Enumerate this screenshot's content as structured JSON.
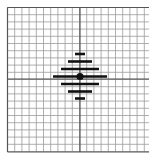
{
  "diagram": {
    "type": "grid-pattern",
    "background": "#ffffff",
    "grid": {
      "left": 7.5,
      "top": 7.5,
      "right": 150,
      "bottom": 152,
      "cell": 7.2,
      "line_color": "#9a9a9a",
      "border_color": "#555555"
    },
    "axes": {
      "x": 80,
      "y": 79,
      "color": "#4a4a4a"
    },
    "bars": [
      {
        "y": 54,
        "x1": 75,
        "x2": 85
      },
      {
        "y": 61.5,
        "x1": 68,
        "x2": 92
      },
      {
        "y": 69,
        "x1": 61,
        "x2": 99
      },
      {
        "y": 76.5,
        "x1": 53,
        "x2": 107
      },
      {
        "y": 84,
        "x1": 61,
        "x2": 99
      },
      {
        "y": 91.5,
        "x1": 68,
        "x2": 92
      },
      {
        "y": 98.5,
        "x1": 75,
        "x2": 85
      }
    ],
    "bar_color": "#111111",
    "bar_thickness": 2.6,
    "center_dot": {
      "x": 80,
      "y": 76.5,
      "r": 3.6,
      "color": "#111111"
    }
  }
}
